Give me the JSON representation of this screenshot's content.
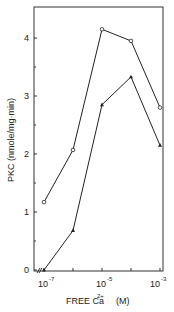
{
  "chart_data": {
    "type": "line",
    "title": "",
    "xlabel": "FREE Ca2+ (M)",
    "ylabel": "PKC (nmole/mg·min)",
    "x": [
      "10^-7",
      "10^-6",
      "10^-5",
      "10^-4",
      "10^-3"
    ],
    "x_log10": [
      -7,
      -6,
      -5,
      -4,
      -3
    ],
    "x_tick_labels": [
      "10^-7",
      "10^-5",
      "10^-3"
    ],
    "y_tick_labels": [
      "0",
      "1",
      "2",
      "3",
      "4"
    ],
    "ylim": [
      0,
      4.5
    ],
    "grid": false,
    "series": [
      {
        "name": "open markers",
        "marker": "open-circle",
        "values": [
          1.17,
          2.07,
          4.15,
          3.95,
          2.8
        ]
      },
      {
        "name": "filled markers",
        "marker": "filled-triangle",
        "values": [
          0.0,
          0.68,
          2.85,
          3.33,
          2.15
        ]
      }
    ]
  },
  "labels": {
    "ylabel": "PKC (nmole/mg·min)",
    "xlabel_main": "FREE Ca",
    "xlabel_sup": "2+",
    "xlabel_unit": "(M)",
    "ytick": [
      "0",
      "1",
      "2",
      "3",
      "4"
    ],
    "xtick_base": "10",
    "xtick_exp": [
      "-7",
      "-5",
      "-3"
    ]
  }
}
